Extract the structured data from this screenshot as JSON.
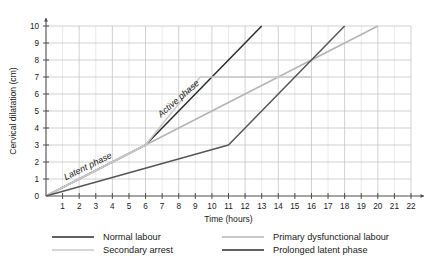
{
  "chart_data": {
    "type": "line",
    "title": "",
    "xlabel": "Time (hours)",
    "ylabel": "Cervical dilatation (cm)",
    "xlim": [
      0,
      22
    ],
    "ylim": [
      0,
      10
    ],
    "xticks": [
      0,
      1,
      2,
      3,
      4,
      5,
      6,
      7,
      8,
      9,
      10,
      11,
      12,
      13,
      14,
      15,
      16,
      17,
      18,
      19,
      20,
      21,
      22
    ],
    "yticks": [
      0,
      1,
      2,
      3,
      4,
      5,
      6,
      7,
      8,
      9,
      10
    ],
    "grid": true,
    "legend_position": "bottom",
    "annotations": [
      {
        "text": "Latent phase",
        "x": 2.6,
        "y": 1.6,
        "rotation": -26
      },
      {
        "text": "Active phase",
        "x": 8.1,
        "y": 5.6,
        "rotation": -41
      }
    ],
    "series": [
      {
        "name": "Normal labour",
        "color": "#2b2b2b",
        "width": 1.5,
        "points": [
          [
            0,
            0
          ],
          [
            6,
            3
          ],
          [
            13,
            10
          ]
        ]
      },
      {
        "name": "Primary dysfunctional labour",
        "color": "#b4b4b4",
        "width": 1.5,
        "points": [
          [
            0,
            0
          ],
          [
            6,
            3
          ],
          [
            20,
            10
          ]
        ]
      },
      {
        "name": "Secondary arrest",
        "color": "#c9c9c9",
        "width": 1.5,
        "points": [
          [
            0,
            0
          ],
          [
            6,
            3
          ],
          [
            9.3,
            7
          ],
          [
            16,
            7
          ]
        ]
      },
      {
        "name": "Prolonged latent phase",
        "color": "#555555",
        "width": 1.5,
        "points": [
          [
            0,
            0
          ],
          [
            11,
            3
          ],
          [
            18,
            10
          ]
        ]
      }
    ]
  },
  "legend": {
    "entries": [
      {
        "label": "Normal labour",
        "color": "#2b2b2b"
      },
      {
        "label": "Secondary arrest",
        "color": "#c9c9c9"
      },
      {
        "label": "Primary dysfunctional labour",
        "color": "#b4b4b4"
      },
      {
        "label": "Prolonged latent phase",
        "color": "#2b2b2b"
      }
    ]
  }
}
